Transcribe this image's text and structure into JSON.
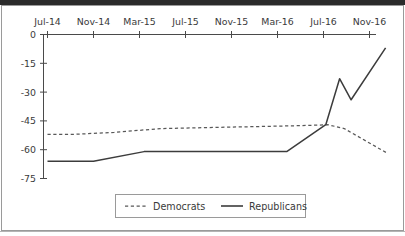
{
  "chart_data": {
    "type": "line",
    "title": "",
    "subtitle": "",
    "xlabel": "",
    "ylabel": "",
    "grid": false,
    "legend_position": "bottom-center",
    "x": [
      "Jul-14",
      "Nov-14",
      "Mar-15",
      "Jul-15",
      "Nov-15",
      "Mar-16",
      "Jul-16",
      "Nov-16"
    ],
    "xtick_labels": [
      "Jul-14",
      "Nov-14",
      "Mar-15",
      "Jul-15",
      "Nov-15",
      "Mar-16",
      "Jul-16",
      "Nov-16"
    ],
    "ytick_labels": [
      "0",
      "-15",
      "-30",
      "-45",
      "-60",
      "-75"
    ],
    "ytick_values": [
      0,
      -15,
      -30,
      -45,
      -60,
      -75
    ],
    "ylim": [
      -78,
      0
    ],
    "xlim": [
      0,
      7.4
    ],
    "series": [
      {
        "name": "Democrats",
        "style": "dashed",
        "color": "#585858",
        "x": [
          0.0,
          0.55,
          1.45,
          2.45,
          3.45,
          4.45,
          5.45,
          6.1,
          6.45,
          7.4
        ],
        "values": [
          -52,
          -52,
          -51,
          -49,
          -48.5,
          -48,
          -47.5,
          -47,
          -49,
          -62
        ]
      },
      {
        "name": "Republicans",
        "style": "solid",
        "color": "#3c3c3c",
        "x": [
          0.0,
          1.0,
          2.1,
          5.2,
          6.05,
          6.35,
          6.6,
          7.35
        ],
        "values": [
          -66,
          -66,
          -61,
          -61,
          -47,
          -23,
          -34,
          -7
        ]
      }
    ],
    "legend": [
      {
        "label": "Democrats",
        "style": "dashed"
      },
      {
        "label": "Republicans",
        "style": "solid"
      }
    ]
  }
}
